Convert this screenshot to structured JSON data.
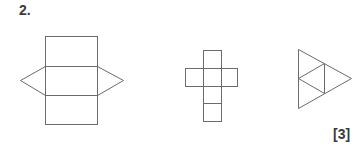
{
  "question": {
    "number": "2.",
    "marks": "[3]"
  },
  "figures": [
    {
      "name": "triangular-prism-net",
      "description": "three stacked rectangles with a triangle on each side"
    },
    {
      "name": "cube-net",
      "description": "cross-shaped net of six squares"
    },
    {
      "name": "tetrahedron-net",
      "description": "large triangle subdivided into four triangles"
    }
  ]
}
